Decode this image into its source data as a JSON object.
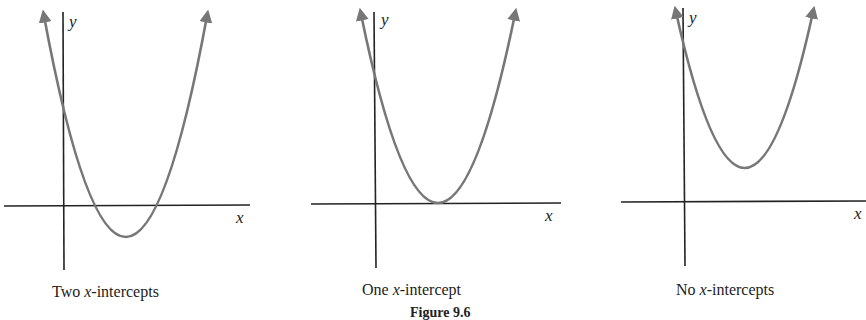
{
  "figure_title": "Figure 9.6",
  "colors": {
    "curve": "#777777",
    "axis": "#222222",
    "text": "#222222"
  },
  "panels": [
    {
      "caption_pre": "Two ",
      "caption_var": "x",
      "caption_post": "-intercepts",
      "x_label": "x",
      "y_label": "y",
      "description": "Upward parabola crossing the x-axis twice"
    },
    {
      "caption_pre": "One ",
      "caption_var": "x",
      "caption_post": "-intercept",
      "x_label": "x",
      "y_label": "y",
      "description": "Upward parabola tangent to the x-axis at its vertex"
    },
    {
      "caption_pre": "No ",
      "caption_var": "x",
      "caption_post": "-intercepts",
      "x_label": "x",
      "y_label": "y",
      "description": "Upward parabola with vertex above the x-axis"
    }
  ]
}
